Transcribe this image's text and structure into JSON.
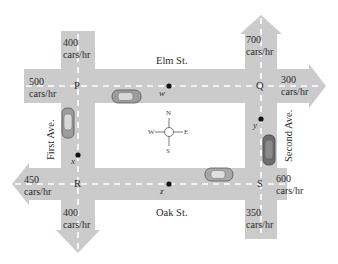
{
  "diagram": {
    "type": "traffic-flow-network",
    "colors": {
      "road": "#cbcbcb",
      "lane_marking": "#ffffff",
      "text": "#2a2a2a",
      "point": "#111111",
      "car_body": "#9a9a9a"
    },
    "streets": {
      "elm": "Elm St.",
      "oak": "Oak St.",
      "first": "First Ave.",
      "second": "Second Ave."
    },
    "intersections": {
      "P": "P",
      "Q": "Q",
      "R": "R",
      "S": "S"
    },
    "segment_points": {
      "w": "w",
      "x": "x",
      "y": "y",
      "z": "z"
    },
    "flows": {
      "first_north_in": {
        "value": "400",
        "unit": "cars/hr"
      },
      "elm_west_in": {
        "value": "500",
        "unit": "cars/hr"
      },
      "second_north_out": {
        "value": "700",
        "unit": "cars/hr"
      },
      "elm_east_out": {
        "value": "300",
        "unit": "cars/hr"
      },
      "oak_west_out": {
        "value": "450",
        "unit": "cars/hr"
      },
      "first_south_out": {
        "value": "400",
        "unit": "cars/hr"
      },
      "oak_east_in": {
        "value": "600",
        "unit": "cars/hr"
      },
      "second_south_in": {
        "value": "350",
        "unit": "cars/hr"
      }
    },
    "compass": {
      "n": "N",
      "s": "S",
      "e": "E",
      "w": "W"
    }
  }
}
